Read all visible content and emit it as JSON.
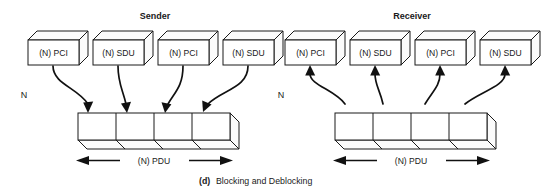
{
  "figure": {
    "caption_prefix": "(d)",
    "caption_text": "Blocking and Deblocking"
  },
  "sides": [
    {
      "id": "sender",
      "title": "Sender",
      "layer_label": "N",
      "pdu_label": "(N) PDU",
      "flow_direction": "down",
      "units": [
        {
          "label": "(N) PCI"
        },
        {
          "label": "(N) SDU"
        },
        {
          "label": "(N) PCI"
        },
        {
          "label": "(N) SDU"
        }
      ],
      "pdu_segments": 4
    },
    {
      "id": "receiver",
      "title": "Receiver",
      "layer_label": "N",
      "pdu_label": "(N) PDU",
      "flow_direction": "up",
      "units": [
        {
          "label": "(N) PCI"
        },
        {
          "label": "(N) SDU"
        },
        {
          "label": "(N) PCI"
        },
        {
          "label": "(N) SDU"
        }
      ],
      "pdu_segments": 4
    }
  ],
  "colors": {
    "ink": "#1a1a1a",
    "paper": "#ffffff"
  }
}
